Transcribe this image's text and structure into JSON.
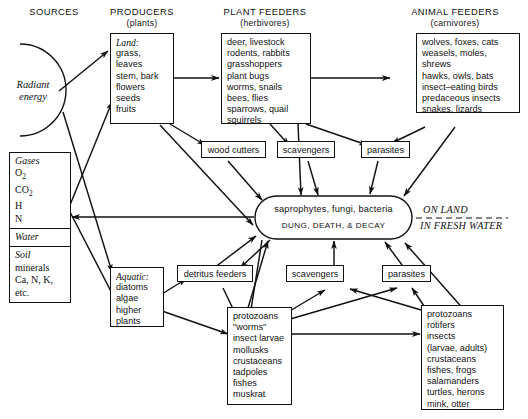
{
  "diagram": {
    "line_color": "#111111",
    "background": "#ffffff"
  },
  "columns": [
    {
      "label": "SOURCES",
      "sub": ""
    },
    {
      "label": "PRODUCERS",
      "sub": "(plants)"
    },
    {
      "label": "PLANT FEEDERS",
      "sub": "(herbivores)"
    },
    {
      "label": "ANIMAL FEEDERS",
      "sub": "(carnivores)"
    }
  ],
  "sources": {
    "radiant": "Radiant\nenergy",
    "radiant_line1": "Radiant",
    "radiant_line2": "energy",
    "gases_head": "Gases",
    "gases_items": "O₂\nCO₂\nH\nN",
    "gases_o2": "O",
    "gases_co2": "CO",
    "gases_h": "H",
    "gases_n": "N",
    "water": "Water",
    "soil_head": "Soil",
    "soil_line1": "minerals",
    "soil_line2": "Ca, N, K,",
    "soil_line3": "etc."
  },
  "producers": {
    "land_head": "Land:",
    "land_items": "grass, leaves\nstem, bark\nflowers\nseeds\nfruits",
    "aquatic_head": "Aquatic:",
    "aquatic_items": "diatoms\nalgae\nhigher\n   plants"
  },
  "plant_feeders": {
    "land_items": "deer, livestock\nrodents, rabbits\ngrasshoppers\nplant bugs\nworms, snails\nbees, flies\nsparrows, quail\nsquirrels",
    "aquatic_items": "protozoans\n\"worms\"\ninsect larvae\nmollusks\ncrustaceans\ntadpoles\nfishes\nmuskrat"
  },
  "animal_feeders": {
    "land_items": "wolves, foxes, cats\nweasels, moles, shrews\nhawks, owls, bats\ninsect–eating birds\npredaceous insects\nsnakes, lizards",
    "aquatic_items": "protozoans\nrotifers\ninsects\n  (larvae, adults)\ncrustaceans\nfishes, frogs\nsalamanders\nturtles, herons\nmink, otter"
  },
  "intermediate": {
    "wood_cutters": "wood cutters",
    "scavengers_land": "scavengers",
    "parasites_land": "parasites",
    "detritus_feeders": "detritus feeders",
    "scavengers_water": "scavengers",
    "parasites_water": "parasites"
  },
  "decomposers": {
    "line1": "saprophytes, fungi, bacteria",
    "line2": "DUNG, DEATH, & DECAY"
  },
  "habitat_divider": {
    "above": "ON LAND",
    "below": "IN FRESH WATER"
  }
}
